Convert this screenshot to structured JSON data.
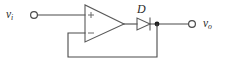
{
  "figure": {
    "kind": "circuit-schematic",
    "background_color": "#ffffff",
    "wire_color": "#4a4a4a",
    "label_color": "#2b2b2b",
    "node_dot_color": "#1e1e1e"
  },
  "labels": {
    "input_symbol": "v",
    "input_subscript": "i",
    "output_symbol": "v",
    "output_subscript": "o",
    "diode": "D",
    "opamp_noninverting": "+",
    "opamp_inverting": "−"
  },
  "terminals": [
    {
      "name": "input-terminal",
      "label": "v i",
      "x": 34,
      "y": 15
    },
    {
      "name": "output-terminal",
      "label": "v o",
      "x": 192,
      "y": 24
    }
  ],
  "nodes": [
    {
      "name": "output-junction",
      "x": 157,
      "y": 24
    }
  ],
  "components": [
    {
      "name": "opamp",
      "type": "operational-amplifier",
      "inputs": [
        "+",
        "−"
      ],
      "noninverting_input_y": 15,
      "inverting_input_y": 33,
      "output_y": 24
    },
    {
      "name": "diode",
      "type": "diode",
      "label": "D",
      "orientation": "anode-left-cathode-right"
    }
  ]
}
